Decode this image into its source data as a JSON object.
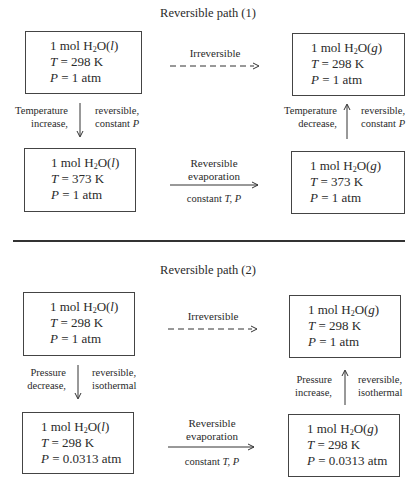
{
  "path1": {
    "title": "Reversible path (1)",
    "top_arrow_label": "Irreversible",
    "start_box": {
      "line1_pre": "1 mol H",
      "sub": "2",
      "line1_post": "O(",
      "phase": "l",
      "line1_end": ")",
      "t_var": "T",
      "t_val": " = 298 K",
      "p_var": "P",
      "p_val": " = 1 atm"
    },
    "end_box": {
      "line1_pre": "1 mol H",
      "sub": "2",
      "line1_post": "O(",
      "phase": "g",
      "line1_end": ")",
      "t_var": "T",
      "t_val": " = 298 K",
      "p_var": "P",
      "p_val": " = 1 atm"
    },
    "mid_left_box": {
      "line1_pre": "1 mol H",
      "sub": "2",
      "line1_post": "O(",
      "phase": "l",
      "line1_end": ")",
      "t_var": "T",
      "t_val": " = 373 K",
      "p_var": "P",
      "p_val": " = 1 atm"
    },
    "mid_right_box": {
      "line1_pre": "1 mol H",
      "sub": "2",
      "line1_post": "O(",
      "phase": "g",
      "line1_end": ")",
      "t_var": "T",
      "t_val": " = 373 K",
      "p_var": "P",
      "p_val": " = 1 atm"
    },
    "left_step": {
      "left1": "Temperature",
      "left2": "increase,",
      "right1": "reversible,",
      "right2_pre": "constant ",
      "right2_var": "P",
      "direction": "down"
    },
    "right_step": {
      "left1": "Temperature",
      "left2": "decrease,",
      "right1": "reversible,",
      "right2_pre": "constant ",
      "right2_var": "P",
      "direction": "up"
    },
    "bottom_arrow": {
      "above1": "Reversible",
      "above2": "evaporation",
      "below_pre": "constant ",
      "below_vars": "T, P"
    }
  },
  "path2": {
    "title": "Reversible path (2)",
    "top_arrow_label": "Irreversible",
    "start_box": {
      "line1_pre": "1 mol H",
      "sub": "2",
      "line1_post": "O(",
      "phase": "l",
      "line1_end": ")",
      "t_var": "T",
      "t_val": " = 298 K",
      "p_var": "P",
      "p_val": " = 1 atm"
    },
    "end_box": {
      "line1_pre": "1 mol H",
      "sub": "2",
      "line1_post": "O(",
      "phase": "g",
      "line1_end": ")",
      "t_var": "T",
      "t_val": " = 298 K",
      "p_var": "P",
      "p_val": " = 1 atm"
    },
    "mid_left_box": {
      "line1_pre": "1 mol H",
      "sub": "2",
      "line1_post": "O(",
      "phase": "l",
      "line1_end": ")",
      "t_var": "T",
      "t_val": " = 298 K",
      "p_var": "P",
      "p_val": " = 0.0313 atm"
    },
    "mid_right_box": {
      "line1_pre": "1 mol H",
      "sub": "2",
      "line1_post": "O(",
      "phase": "g",
      "line1_end": ")",
      "t_var": "T",
      "t_val": " = 298 K",
      "p_var": "P",
      "p_val": " = 0.0313 atm"
    },
    "left_step": {
      "left1": "Pressure",
      "left2": "decrease,",
      "right1": "reversible,",
      "right2": "isothermal",
      "direction": "down"
    },
    "right_step": {
      "left1": "Pressure",
      "left2": "increase,",
      "right1": "reversible,",
      "right2": "isothermal",
      "direction": "up"
    },
    "bottom_arrow": {
      "above1": "Reversible",
      "above2": "evaporation",
      "below_pre": "constant ",
      "below_vars": "T, P"
    }
  }
}
